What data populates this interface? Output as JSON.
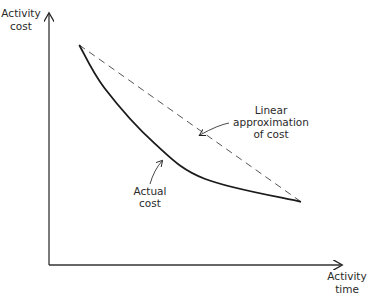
{
  "chart_data": {
    "type": "line",
    "title": "",
    "xlabel": [
      "Activity",
      "time"
    ],
    "ylabel": [
      "Activity",
      "cost"
    ],
    "grid": false,
    "ticks": false,
    "series": [
      {
        "name": "Actual cost",
        "style": "solid",
        "shape": "convex decreasing curve",
        "points": [
          [
            0.12,
            0.87
          ],
          [
            0.22,
            0.7
          ],
          [
            0.42,
            0.48
          ],
          [
            0.62,
            0.34
          ],
          [
            1.0,
            0.25
          ]
        ]
      },
      {
        "name": "Linear approximation of cost",
        "style": "dashed",
        "shape": "straight line",
        "points": [
          [
            0.12,
            0.87
          ],
          [
            1.0,
            0.25
          ]
        ]
      }
    ],
    "annotations": [
      {
        "text": [
          "Linear",
          "approximation",
          "of cost"
        ],
        "points_to": "Linear approximation of cost"
      },
      {
        "text": [
          "Actual",
          "cost"
        ],
        "points_to": "Actual cost"
      }
    ],
    "colors": {
      "ink": "#1a1a1a",
      "dashed": "#555555"
    }
  }
}
